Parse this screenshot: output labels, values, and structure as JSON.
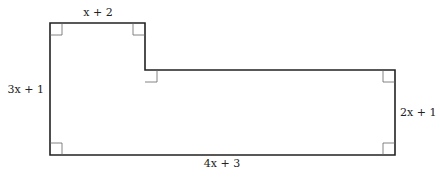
{
  "diagram": {
    "type": "rectilinear-polygon",
    "vertices": [
      [
        50,
        23
      ],
      [
        145,
        23
      ],
      [
        145,
        70
      ],
      [
        395,
        70
      ],
      [
        395,
        155
      ],
      [
        50,
        155
      ]
    ],
    "stroke_color": "#222222",
    "marker_color": "#666666",
    "labels": {
      "top": "x + 2",
      "left": "3x + 1",
      "right": "2x + 1",
      "bottom": "4x + 3"
    },
    "right_angle_markers": 6
  }
}
